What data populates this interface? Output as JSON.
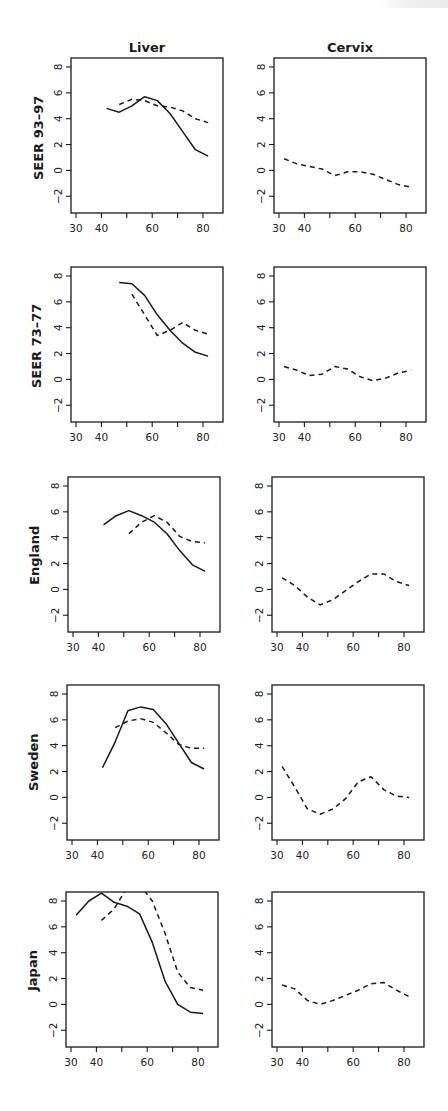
{
  "figure": {
    "column_titles": [
      "Liver",
      "Cervix"
    ],
    "row_labels": [
      "SEER 93–97",
      "SEER 73–77",
      "England",
      "Sweden",
      "Japan"
    ],
    "line_color": "#1a1a1a"
  },
  "chart_data": [
    {
      "type": "line",
      "panel": "Liver / SEER 93-97",
      "row": 0,
      "col": 0,
      "title": "Liver",
      "ylabel": "SEER 93–97",
      "xlabel": "",
      "xticks": [
        30,
        40,
        50,
        60,
        70,
        80
      ],
      "xtick_labels": [
        "30",
        "40",
        "",
        "60",
        "",
        "80"
      ],
      "yticks": [
        -2,
        0,
        2,
        4,
        6,
        8
      ],
      "ylim": [
        -2.9,
        8.6
      ],
      "xlim": [
        28,
        88
      ],
      "grid": false,
      "series": [
        {
          "name": "solid",
          "style": "solid",
          "x": [
            42,
            47,
            52,
            57,
            62,
            67,
            72,
            77,
            82
          ],
          "y": [
            4.8,
            4.5,
            5.0,
            5.7,
            5.4,
            4.4,
            3.0,
            1.6,
            1.1
          ]
        },
        {
          "name": "dashed",
          "style": "dashed",
          "x": [
            47,
            52,
            57,
            62,
            67,
            72,
            77,
            82
          ],
          "y": [
            5.1,
            5.5,
            5.4,
            5.0,
            4.9,
            4.6,
            4.0,
            3.7
          ]
        }
      ]
    },
    {
      "type": "line",
      "panel": "Cervix / SEER 93-97",
      "row": 0,
      "col": 1,
      "title": "Cervix",
      "ylabel": "",
      "xlabel": "",
      "xticks": [
        30,
        40,
        50,
        60,
        70,
        80
      ],
      "xtick_labels": [
        "30",
        "40",
        "",
        "60",
        "",
        "80"
      ],
      "yticks": [
        -2,
        0,
        2,
        4,
        6,
        8
      ],
      "ylim": [
        -2.9,
        8.6
      ],
      "xlim": [
        28,
        88
      ],
      "grid": false,
      "series": [
        {
          "name": "dashed",
          "style": "dashed",
          "x": [
            32,
            37,
            42,
            47,
            52,
            57,
            62,
            67,
            72,
            77,
            82
          ],
          "y": [
            0.9,
            0.5,
            0.3,
            0.1,
            -0.4,
            -0.1,
            -0.1,
            -0.3,
            -0.7,
            -1.1,
            -1.3
          ]
        }
      ]
    },
    {
      "type": "line",
      "panel": "Liver / SEER 73-77",
      "row": 1,
      "col": 0,
      "title": "",
      "ylabel": "SEER 73–77",
      "xlabel": "",
      "xticks": [
        30,
        40,
        50,
        60,
        70,
        80
      ],
      "xtick_labels": [
        "30",
        "40",
        "",
        "60",
        "",
        "80"
      ],
      "yticks": [
        -2,
        0,
        2,
        4,
        6,
        8
      ],
      "ylim": [
        -2.9,
        8.6
      ],
      "xlim": [
        28,
        88
      ],
      "grid": false,
      "series": [
        {
          "name": "solid",
          "style": "solid",
          "x": [
            47,
            52,
            57,
            62,
            67,
            72,
            77,
            82
          ],
          "y": [
            7.5,
            7.4,
            6.5,
            5.0,
            3.8,
            2.8,
            2.1,
            1.8
          ]
        },
        {
          "name": "dashed",
          "style": "dashed",
          "x": [
            52,
            57,
            62,
            67,
            72,
            77,
            82
          ],
          "y": [
            6.6,
            5.0,
            3.4,
            3.8,
            4.4,
            3.8,
            3.5
          ]
        }
      ]
    },
    {
      "type": "line",
      "panel": "Cervix / SEER 73-77",
      "row": 1,
      "col": 1,
      "title": "",
      "ylabel": "",
      "xlabel": "",
      "xticks": [
        30,
        40,
        50,
        60,
        70,
        80
      ],
      "xtick_labels": [
        "30",
        "40",
        "",
        "60",
        "",
        "80"
      ],
      "yticks": [
        -2,
        0,
        2,
        4,
        6,
        8
      ],
      "ylim": [
        -2.9,
        8.6
      ],
      "xlim": [
        28,
        88
      ],
      "grid": false,
      "series": [
        {
          "name": "dashed",
          "style": "dashed",
          "x": [
            32,
            37,
            42,
            47,
            52,
            57,
            62,
            67,
            72,
            77,
            82
          ],
          "y": [
            1.0,
            0.7,
            0.3,
            0.4,
            1.0,
            0.8,
            0.2,
            -0.1,
            0.1,
            0.5,
            0.7
          ]
        }
      ]
    },
    {
      "type": "line",
      "panel": "Liver / England",
      "row": 2,
      "col": 0,
      "title": "",
      "ylabel": "England",
      "xlabel": "",
      "xticks": [
        30,
        40,
        50,
        60,
        70,
        80
      ],
      "xtick_labels": [
        "30",
        "40",
        "",
        "60",
        "",
        "80"
      ],
      "yticks": [
        -2,
        0,
        2,
        4,
        6,
        8
      ],
      "ylim": [
        -2.9,
        8.6
      ],
      "xlim": [
        28,
        88
      ],
      "grid": false,
      "series": [
        {
          "name": "solid",
          "style": "solid",
          "x": [
            42,
            47,
            52,
            57,
            62,
            67,
            72,
            77,
            82
          ],
          "y": [
            5.0,
            5.7,
            6.1,
            5.7,
            5.2,
            4.3,
            3.0,
            1.9,
            1.4
          ]
        },
        {
          "name": "dashed",
          "style": "dashed",
          "x": [
            52,
            57,
            62,
            67,
            72,
            77,
            82
          ],
          "y": [
            4.3,
            5.2,
            5.7,
            5.2,
            4.1,
            3.7,
            3.6
          ]
        }
      ]
    },
    {
      "type": "line",
      "panel": "Cervix / England",
      "row": 2,
      "col": 1,
      "title": "",
      "ylabel": "",
      "xlabel": "",
      "xticks": [
        30,
        40,
        50,
        60,
        70,
        80
      ],
      "xtick_labels": [
        "30",
        "40",
        "",
        "60",
        "",
        "80"
      ],
      "yticks": [
        -2,
        0,
        2,
        4,
        6,
        8
      ],
      "ylim": [
        -2.9,
        8.6
      ],
      "xlim": [
        28,
        88
      ],
      "grid": false,
      "series": [
        {
          "name": "dashed",
          "style": "dashed",
          "x": [
            32,
            37,
            42,
            47,
            52,
            57,
            62,
            67,
            72,
            77,
            82
          ],
          "y": [
            0.9,
            0.3,
            -0.6,
            -1.2,
            -0.8,
            -0.1,
            0.6,
            1.2,
            1.2,
            0.6,
            0.3
          ]
        }
      ]
    },
    {
      "type": "line",
      "panel": "Liver / Sweden",
      "row": 3,
      "col": 0,
      "title": "",
      "ylabel": "Sweden",
      "xlabel": "",
      "xticks": [
        30,
        40,
        50,
        60,
        70,
        80
      ],
      "xtick_labels": [
        "30",
        "40",
        "",
        "60",
        "",
        "80"
      ],
      "yticks": [
        -2,
        0,
        2,
        4,
        6,
        8
      ],
      "ylim": [
        -2.9,
        8.6
      ],
      "xlim": [
        28,
        88
      ],
      "grid": false,
      "series": [
        {
          "name": "solid",
          "style": "solid",
          "x": [
            42,
            47,
            52,
            57,
            62,
            67,
            72,
            77,
            82
          ],
          "y": [
            2.3,
            4.3,
            6.7,
            7.0,
            6.8,
            5.7,
            4.2,
            2.7,
            2.2
          ]
        },
        {
          "name": "dashed",
          "style": "dashed",
          "x": [
            47,
            52,
            57,
            62,
            67,
            72,
            77,
            82
          ],
          "y": [
            5.4,
            5.9,
            6.1,
            5.8,
            5.0,
            4.1,
            3.8,
            3.8
          ]
        }
      ]
    },
    {
      "type": "line",
      "panel": "Cervix / Sweden",
      "row": 3,
      "col": 1,
      "title": "",
      "ylabel": "",
      "xlabel": "",
      "xticks": [
        30,
        40,
        50,
        60,
        70,
        80
      ],
      "xtick_labels": [
        "30",
        "40",
        "",
        "60",
        "",
        "80"
      ],
      "yticks": [
        -2,
        0,
        2,
        4,
        6,
        8
      ],
      "ylim": [
        -2.9,
        8.6
      ],
      "xlim": [
        28,
        88
      ],
      "grid": false,
      "series": [
        {
          "name": "dashed",
          "style": "dashed",
          "x": [
            32,
            37,
            42,
            47,
            52,
            57,
            62,
            67,
            72,
            77,
            82
          ],
          "y": [
            2.4,
            0.8,
            -0.9,
            -1.3,
            -0.9,
            -0.1,
            1.2,
            1.6,
            0.6,
            0.1,
            0.0
          ]
        }
      ]
    },
    {
      "type": "line",
      "panel": "Liver / Japan",
      "row": 4,
      "col": 0,
      "title": "",
      "ylabel": "Japan",
      "xlabel": "",
      "xticks": [
        30,
        40,
        50,
        60,
        70,
        80
      ],
      "xtick_labels": [
        "30",
        "40",
        "",
        "60",
        "",
        "80"
      ],
      "yticks": [
        -2,
        0,
        2,
        4,
        6,
        8
      ],
      "ylim": [
        -2.9,
        8.6
      ],
      "xlim": [
        28,
        88
      ],
      "grid": false,
      "series": [
        {
          "name": "solid",
          "style": "solid",
          "x": [
            32,
            37,
            42,
            47,
            52,
            57,
            62,
            67,
            72,
            77,
            82
          ],
          "y": [
            6.9,
            8.0,
            8.6,
            7.9,
            7.6,
            7.0,
            4.8,
            1.8,
            0.0,
            -0.6,
            -0.7
          ]
        },
        {
          "name": "dashed",
          "style": "dashed",
          "x": [
            42,
            47,
            52,
            57,
            62,
            67,
            72,
            77,
            82
          ],
          "y": [
            6.5,
            7.4,
            9.0,
            9.3,
            8.0,
            5.5,
            2.5,
            1.3,
            1.1
          ]
        }
      ]
    },
    {
      "type": "line",
      "panel": "Cervix / Japan",
      "row": 4,
      "col": 1,
      "title": "",
      "ylabel": "",
      "xlabel": "",
      "xticks": [
        30,
        40,
        50,
        60,
        70,
        80
      ],
      "xtick_labels": [
        "30",
        "40",
        "",
        "60",
        "",
        "80"
      ],
      "yticks": [
        -2,
        0,
        2,
        4,
        6,
        8
      ],
      "ylim": [
        -2.9,
        8.6
      ],
      "xlim": [
        28,
        88
      ],
      "grid": false,
      "series": [
        {
          "name": "dashed",
          "style": "dashed",
          "x": [
            32,
            37,
            42,
            47,
            52,
            57,
            62,
            67,
            72,
            77,
            82
          ],
          "y": [
            1.5,
            1.2,
            0.3,
            0.0,
            0.3,
            0.7,
            1.1,
            1.6,
            1.7,
            1.1,
            0.6
          ]
        }
      ]
    }
  ]
}
